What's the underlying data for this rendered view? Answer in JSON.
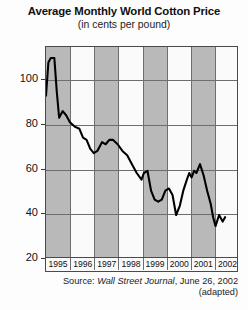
{
  "chart_data": {
    "type": "line",
    "title": "Average Monthly World Cotton Price",
    "subtitle": "(in cents per pound)",
    "xlabel": "",
    "ylabel": "",
    "ylim": [
      20,
      115
    ],
    "yticks": [
      20,
      40,
      60,
      80,
      100
    ],
    "ytick_labels": [
      "20",
      "40",
      "60",
      "80",
      "100"
    ],
    "xlim": [
      1995,
      2003
    ],
    "categories": [
      "1995",
      "1996",
      "1997",
      "1998",
      "1999",
      "2000",
      "2001",
      "2002"
    ],
    "grid": "horizontal gridlines at each y tick; vertical gridlines at each year boundary; alternating shaded year bands",
    "legend": "none",
    "series": [
      {
        "name": "Average monthly world cotton price",
        "units": "cents per pound",
        "points": [
          {
            "x": 1995.0,
            "y": 93
          },
          {
            "x": 1995.1,
            "y": 108
          },
          {
            "x": 1995.2,
            "y": 110
          },
          {
            "x": 1995.35,
            "y": 110
          },
          {
            "x": 1995.45,
            "y": 95
          },
          {
            "x": 1995.55,
            "y": 83
          },
          {
            "x": 1995.7,
            "y": 86
          },
          {
            "x": 1995.85,
            "y": 84
          },
          {
            "x": 1996.0,
            "y": 81
          },
          {
            "x": 1996.2,
            "y": 79
          },
          {
            "x": 1996.4,
            "y": 78
          },
          {
            "x": 1996.55,
            "y": 74
          },
          {
            "x": 1996.7,
            "y": 73
          },
          {
            "x": 1996.85,
            "y": 69
          },
          {
            "x": 1997.0,
            "y": 67
          },
          {
            "x": 1997.15,
            "y": 68
          },
          {
            "x": 1997.35,
            "y": 72
          },
          {
            "x": 1997.5,
            "y": 71
          },
          {
            "x": 1997.65,
            "y": 73
          },
          {
            "x": 1997.8,
            "y": 73
          },
          {
            "x": 1998.0,
            "y": 71
          },
          {
            "x": 1998.2,
            "y": 68
          },
          {
            "x": 1998.4,
            "y": 66
          },
          {
            "x": 1998.6,
            "y": 62
          },
          {
            "x": 1998.8,
            "y": 58
          },
          {
            "x": 1999.0,
            "y": 55
          },
          {
            "x": 1999.1,
            "y": 58
          },
          {
            "x": 1999.25,
            "y": 59
          },
          {
            "x": 1999.4,
            "y": 50
          },
          {
            "x": 1999.55,
            "y": 46
          },
          {
            "x": 1999.7,
            "y": 45
          },
          {
            "x": 1999.85,
            "y": 46
          },
          {
            "x": 2000.0,
            "y": 50
          },
          {
            "x": 2000.15,
            "y": 51
          },
          {
            "x": 2000.3,
            "y": 48
          },
          {
            "x": 2000.45,
            "y": 39
          },
          {
            "x": 2000.6,
            "y": 43
          },
          {
            "x": 2000.75,
            "y": 50
          },
          {
            "x": 2000.9,
            "y": 55
          },
          {
            "x": 2001.0,
            "y": 58
          },
          {
            "x": 2001.1,
            "y": 56
          },
          {
            "x": 2001.2,
            "y": 59
          },
          {
            "x": 2001.3,
            "y": 58
          },
          {
            "x": 2001.45,
            "y": 62
          },
          {
            "x": 2001.6,
            "y": 57
          },
          {
            "x": 2001.75,
            "y": 50
          },
          {
            "x": 2001.9,
            "y": 44
          },
          {
            "x": 2002.0,
            "y": 38
          },
          {
            "x": 2002.1,
            "y": 34
          },
          {
            "x": 2002.25,
            "y": 39
          },
          {
            "x": 2002.4,
            "y": 36
          },
          {
            "x": 2002.5,
            "y": 38
          }
        ]
      }
    ],
    "source_note": {
      "prefix": "Source:",
      "publication": "Wall Street Journal",
      "suffix": ", June 26, 2002",
      "adapted": "(adapted)"
    }
  },
  "axes": {
    "y_ticks": [
      "100",
      "80",
      "60",
      "40",
      "20"
    ],
    "x_years": [
      "1995",
      "1996",
      "1997",
      "1998",
      "1999",
      "2000",
      "2001",
      "2002"
    ]
  },
  "colors": {
    "line": "#000000",
    "band_shaded": "#b9b9b9",
    "band_plain": "#fafafa",
    "grid": "#6e6e6e",
    "frame": "#4a4a4a",
    "text": "#111111"
  }
}
